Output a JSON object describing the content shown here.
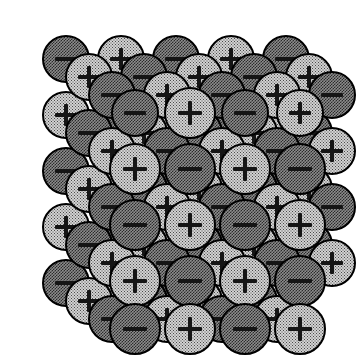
{
  "figure": {
    "title": "Ionic crystal lattice",
    "background_color": "#ffffff",
    "projection": "oblique",
    "grid_columns": 5,
    "grid_rows": 5,
    "depth_layers": 4,
    "sphere_diameter_px": 48,
    "spacing_x_px": 55,
    "spacing_y_px": 56,
    "depth_offset_x_px": -23,
    "depth_offset_y_px": -18,
    "front_layer_origin_x_px": 135,
    "front_layer_origin_y_px": 113
  },
  "legend": {
    "cation": {
      "name": "cation",
      "symbol": "+",
      "label": "positive ion",
      "fill_color": "#d2d2d2",
      "dither": "sparse-dot",
      "outline_color": "#000000"
    },
    "anion": {
      "name": "anion",
      "symbol": "−",
      "label": "negative ion",
      "fill_color": "#8c8c8c",
      "dither": "dense-checker",
      "outline_color": "#000000"
    }
  },
  "chart_data": {
    "type": "scatter",
    "title": "Ionic crystal lattice",
    "xlabel": "",
    "ylabel": "",
    "categories": [
      "cation",
      "anion"
    ],
    "values": [
      50,
      50
    ],
    "note": "Charge at lattice site (i,j,k) = '+' when (i+j+k) is even, '−' when odd"
  },
  "ions": [
    {
      "i": 0,
      "j": 0,
      "k": 3,
      "cx": 66,
      "cy": 59,
      "r": 24,
      "type": "anion",
      "symbol": "−"
    },
    {
      "i": 1,
      "j": 0,
      "k": 3,
      "cx": 121,
      "cy": 59,
      "r": 24,
      "type": "cation",
      "symbol": "+"
    },
    {
      "i": 2,
      "j": 0,
      "k": 3,
      "cx": 176,
      "cy": 59,
      "r": 24,
      "type": "anion",
      "symbol": "−"
    },
    {
      "i": 3,
      "j": 0,
      "k": 3,
      "cx": 231,
      "cy": 59,
      "r": 24,
      "type": "cation",
      "symbol": "+"
    },
    {
      "i": 4,
      "j": 0,
      "k": 3,
      "cx": 286,
      "cy": 59,
      "r": 24,
      "type": "anion",
      "symbol": "−"
    },
    {
      "i": 0,
      "j": 0,
      "k": 2,
      "cx": 89,
      "cy": 77,
      "r": 24,
      "type": "cation",
      "symbol": "+"
    },
    {
      "i": 1,
      "j": 0,
      "k": 2,
      "cx": 144,
      "cy": 77,
      "r": 24,
      "type": "anion",
      "symbol": "−"
    },
    {
      "i": 2,
      "j": 0,
      "k": 2,
      "cx": 199,
      "cy": 77,
      "r": 24,
      "type": "cation",
      "symbol": "+"
    },
    {
      "i": 3,
      "j": 0,
      "k": 2,
      "cx": 254,
      "cy": 77,
      "r": 24,
      "type": "anion",
      "symbol": "−"
    },
    {
      "i": 4,
      "j": 0,
      "k": 2,
      "cx": 309,
      "cy": 77,
      "r": 24,
      "type": "cation",
      "symbol": "+"
    },
    {
      "i": 0,
      "j": 0,
      "k": 1,
      "cx": 112,
      "cy": 95,
      "r": 24,
      "type": "anion",
      "symbol": "−"
    },
    {
      "i": 1,
      "j": 0,
      "k": 1,
      "cx": 167,
      "cy": 95,
      "r": 24,
      "type": "cation",
      "symbol": "+"
    },
    {
      "i": 2,
      "j": 0,
      "k": 1,
      "cx": 222,
      "cy": 95,
      "r": 24,
      "type": "anion",
      "symbol": "−"
    },
    {
      "i": 3,
      "j": 0,
      "k": 1,
      "cx": 277,
      "cy": 95,
      "r": 24,
      "type": "cation",
      "symbol": "+"
    },
    {
      "i": 4,
      "j": 0,
      "k": 1,
      "cx": 332,
      "cy": 95,
      "r": 24,
      "type": "anion",
      "symbol": "−"
    },
    {
      "i": 0,
      "j": 0,
      "k": 0,
      "cx": 135,
      "cy": 113,
      "r": 24,
      "type": "anion",
      "symbol": "−"
    },
    {
      "i": 1,
      "j": 0,
      "k": 0,
      "cx": 190,
      "cy": 113,
      "r": 24,
      "type": "cation",
      "symbol": "+"
    },
    {
      "i": 2,
      "j": 0,
      "k": 0,
      "cx": 245,
      "cy": 113,
      "r": 24,
      "type": "anion",
      "symbol": "−"
    },
    {
      "i": 3,
      "j": 0,
      "k": 0,
      "cx": 300,
      "cy": 113,
      "r": 24,
      "type": "cation",
      "symbol": "+"
    },
    {
      "i": 0,
      "j": 1,
      "k": 3,
      "cx": 66,
      "cy": 115,
      "r": 24,
      "type": "cation",
      "symbol": "+"
    },
    {
      "i": 0,
      "j": 2,
      "k": 3,
      "cx": 66,
      "cy": 171,
      "r": 24,
      "type": "anion",
      "symbol": "−"
    },
    {
      "i": 0,
      "j": 3,
      "k": 3,
      "cx": 66,
      "cy": 227,
      "r": 24,
      "type": "cation",
      "symbol": "+"
    },
    {
      "i": 0,
      "j": 4,
      "k": 3,
      "cx": 66,
      "cy": 283,
      "r": 24,
      "type": "anion",
      "symbol": "−"
    },
    {
      "i": 0,
      "j": 1,
      "k": 2,
      "cx": 89,
      "cy": 133,
      "r": 24,
      "type": "anion",
      "symbol": "−"
    },
    {
      "i": 0,
      "j": 2,
      "k": 2,
      "cx": 89,
      "cy": 189,
      "r": 24,
      "type": "cation",
      "symbol": "+"
    },
    {
      "i": 0,
      "j": 3,
      "k": 2,
      "cx": 89,
      "cy": 245,
      "r": 24,
      "type": "anion",
      "symbol": "−"
    },
    {
      "i": 0,
      "j": 4,
      "k": 2,
      "cx": 89,
      "cy": 301,
      "r": 24,
      "type": "cation",
      "symbol": "+"
    },
    {
      "i": 0,
      "j": 1,
      "k": 1,
      "cx": 112,
      "cy": 151,
      "r": 24,
      "type": "cation",
      "symbol": "+"
    },
    {
      "i": 0,
      "j": 2,
      "k": 1,
      "cx": 112,
      "cy": 207,
      "r": 24,
      "type": "anion",
      "symbol": "−"
    },
    {
      "i": 0,
      "j": 3,
      "k": 1,
      "cx": 112,
      "cy": 263,
      "r": 24,
      "type": "cation",
      "symbol": "+"
    },
    {
      "i": 0,
      "j": 4,
      "k": 1,
      "cx": 112,
      "cy": 319,
      "r": 24,
      "type": "anion",
      "symbol": "−"
    },
    {
      "i": 1,
      "j": 1,
      "k": 3,
      "cx": 121,
      "cy": 115,
      "r": 24,
      "type": "anion",
      "symbol": "−"
    },
    {
      "i": 2,
      "j": 1,
      "k": 3,
      "cx": 176,
      "cy": 115,
      "r": 24,
      "type": "cation",
      "symbol": "+"
    },
    {
      "i": 3,
      "j": 1,
      "k": 3,
      "cx": 231,
      "cy": 115,
      "r": 24,
      "type": "anion",
      "symbol": "−"
    },
    {
      "i": 4,
      "j": 1,
      "k": 3,
      "cx": 286,
      "cy": 115,
      "r": 24,
      "type": "cation",
      "symbol": "+"
    },
    {
      "i": 1,
      "j": 1,
      "k": 2,
      "cx": 144,
      "cy": 133,
      "r": 24,
      "type": "cation",
      "symbol": "+"
    },
    {
      "i": 2,
      "j": 1,
      "k": 2,
      "cx": 199,
      "cy": 133,
      "r": 24,
      "type": "anion",
      "symbol": "−"
    },
    {
      "i": 3,
      "j": 1,
      "k": 2,
      "cx": 254,
      "cy": 133,
      "r": 24,
      "type": "cation",
      "symbol": "+"
    },
    {
      "i": 4,
      "j": 1,
      "k": 2,
      "cx": 309,
      "cy": 133,
      "r": 24,
      "type": "anion",
      "symbol": "−"
    },
    {
      "i": 1,
      "j": 1,
      "k": 1,
      "cx": 167,
      "cy": 151,
      "r": 24,
      "type": "anion",
      "symbol": "−"
    },
    {
      "i": 2,
      "j": 1,
      "k": 1,
      "cx": 222,
      "cy": 151,
      "r": 24,
      "type": "cation",
      "symbol": "+"
    },
    {
      "i": 3,
      "j": 1,
      "k": 1,
      "cx": 277,
      "cy": 151,
      "r": 24,
      "type": "anion",
      "symbol": "−"
    },
    {
      "i": 4,
      "j": 1,
      "k": 1,
      "cx": 332,
      "cy": 151,
      "r": 24,
      "type": "cation",
      "symbol": "+"
    },
    {
      "i": 1,
      "j": 2,
      "k": 3,
      "cx": 121,
      "cy": 171,
      "r": 24,
      "type": "cation",
      "symbol": "+"
    },
    {
      "i": 2,
      "j": 2,
      "k": 3,
      "cx": 176,
      "cy": 171,
      "r": 24,
      "type": "anion",
      "symbol": "−"
    },
    {
      "i": 3,
      "j": 2,
      "k": 3,
      "cx": 231,
      "cy": 171,
      "r": 24,
      "type": "cation",
      "symbol": "+"
    },
    {
      "i": 4,
      "j": 2,
      "k": 3,
      "cx": 286,
      "cy": 171,
      "r": 24,
      "type": "anion",
      "symbol": "−"
    },
    {
      "i": 1,
      "j": 2,
      "k": 2,
      "cx": 144,
      "cy": 189,
      "r": 24,
      "type": "anion",
      "symbol": "−"
    },
    {
      "i": 2,
      "j": 2,
      "k": 2,
      "cx": 199,
      "cy": 189,
      "r": 24,
      "type": "cation",
      "symbol": "+"
    },
    {
      "i": 3,
      "j": 2,
      "k": 2,
      "cx": 254,
      "cy": 189,
      "r": 24,
      "type": "anion",
      "symbol": "−"
    },
    {
      "i": 4,
      "j": 2,
      "k": 2,
      "cx": 309,
      "cy": 189,
      "r": 24,
      "type": "cation",
      "symbol": "+"
    },
    {
      "i": 1,
      "j": 2,
      "k": 1,
      "cx": 167,
      "cy": 207,
      "r": 24,
      "type": "cation",
      "symbol": "+"
    },
    {
      "i": 2,
      "j": 2,
      "k": 1,
      "cx": 222,
      "cy": 207,
      "r": 24,
      "type": "anion",
      "symbol": "−"
    },
    {
      "i": 3,
      "j": 2,
      "k": 1,
      "cx": 277,
      "cy": 207,
      "r": 24,
      "type": "cation",
      "symbol": "+"
    },
    {
      "i": 4,
      "j": 2,
      "k": 1,
      "cx": 332,
      "cy": 207,
      "r": 24,
      "type": "anion",
      "symbol": "−"
    },
    {
      "i": 1,
      "j": 3,
      "k": 3,
      "cx": 121,
      "cy": 227,
      "r": 24,
      "type": "anion",
      "symbol": "−"
    },
    {
      "i": 2,
      "j": 3,
      "k": 3,
      "cx": 176,
      "cy": 227,
      "r": 24,
      "type": "cation",
      "symbol": "+"
    },
    {
      "i": 3,
      "j": 3,
      "k": 3,
      "cx": 231,
      "cy": 227,
      "r": 24,
      "type": "anion",
      "symbol": "−"
    },
    {
      "i": 4,
      "j": 3,
      "k": 3,
      "cx": 286,
      "cy": 227,
      "r": 24,
      "type": "cation",
      "symbol": "+"
    },
    {
      "i": 1,
      "j": 3,
      "k": 2,
      "cx": 144,
      "cy": 245,
      "r": 24,
      "type": "cation",
      "symbol": "+"
    },
    {
      "i": 2,
      "j": 3,
      "k": 2,
      "cx": 199,
      "cy": 245,
      "r": 24,
      "type": "anion",
      "symbol": "−"
    },
    {
      "i": 3,
      "j": 3,
      "k": 2,
      "cx": 254,
      "cy": 245,
      "r": 24,
      "type": "cation",
      "symbol": "+"
    },
    {
      "i": 4,
      "j": 3,
      "k": 2,
      "cx": 309,
      "cy": 245,
      "r": 24,
      "type": "anion",
      "symbol": "−"
    },
    {
      "i": 1,
      "j": 3,
      "k": 1,
      "cx": 167,
      "cy": 263,
      "r": 24,
      "type": "anion",
      "symbol": "−"
    },
    {
      "i": 2,
      "j": 3,
      "k": 1,
      "cx": 222,
      "cy": 263,
      "r": 24,
      "type": "cation",
      "symbol": "+"
    },
    {
      "i": 3,
      "j": 3,
      "k": 1,
      "cx": 277,
      "cy": 263,
      "r": 24,
      "type": "anion",
      "symbol": "−"
    },
    {
      "i": 4,
      "j": 3,
      "k": 1,
      "cx": 332,
      "cy": 263,
      "r": 24,
      "type": "cation",
      "symbol": "+"
    },
    {
      "i": 1,
      "j": 4,
      "k": 3,
      "cx": 121,
      "cy": 283,
      "r": 24,
      "type": "cation",
      "symbol": "+"
    },
    {
      "i": 2,
      "j": 4,
      "k": 3,
      "cx": 176,
      "cy": 283,
      "r": 24,
      "type": "anion",
      "symbol": "−"
    },
    {
      "i": 1,
      "j": 4,
      "k": 2,
      "cx": 144,
      "cy": 301,
      "r": 24,
      "type": "anion",
      "symbol": "−"
    },
    {
      "i": 2,
      "j": 4,
      "k": 2,
      "cx": 199,
      "cy": 301,
      "r": 24,
      "type": "cation",
      "symbol": "+"
    },
    {
      "i": 3,
      "j": 4,
      "k": 2,
      "cx": 254,
      "cy": 301,
      "r": 24,
      "type": "anion",
      "symbol": "−"
    },
    {
      "i": 1,
      "j": 4,
      "k": 1,
      "cx": 167,
      "cy": 319,
      "r": 24,
      "type": "cation",
      "symbol": "+"
    },
    {
      "i": 2,
      "j": 4,
      "k": 1,
      "cx": 222,
      "cy": 319,
      "r": 24,
      "type": "anion",
      "symbol": "−"
    },
    {
      "i": 3,
      "j": 4,
      "k": 1,
      "cx": 277,
      "cy": 319,
      "r": 24,
      "type": "cation",
      "symbol": "+"
    },
    {
      "i": 1,
      "j": 0,
      "k": 0,
      "cx": 190,
      "cy": 113,
      "r": 26,
      "type": "cation",
      "symbol": "+",
      "front": true
    },
    {
      "i": 0,
      "j": 1,
      "k": 0,
      "cx": 135,
      "cy": 169,
      "r": 26,
      "type": "cation",
      "symbol": "+",
      "front": true
    },
    {
      "i": 1,
      "j": 1,
      "k": 0,
      "cx": 190,
      "cy": 169,
      "r": 26,
      "type": "anion",
      "symbol": "−",
      "front": true
    },
    {
      "i": 2,
      "j": 1,
      "k": 0,
      "cx": 245,
      "cy": 169,
      "r": 26,
      "type": "cation",
      "symbol": "+",
      "front": true
    },
    {
      "i": 3,
      "j": 1,
      "k": 0,
      "cx": 300,
      "cy": 169,
      "r": 26,
      "type": "anion",
      "symbol": "−",
      "front": true
    },
    {
      "i": 0,
      "j": 2,
      "k": 0,
      "cx": 135,
      "cy": 225,
      "r": 26,
      "type": "anion",
      "symbol": "−",
      "front": true
    },
    {
      "i": 1,
      "j": 2,
      "k": 0,
      "cx": 190,
      "cy": 225,
      "r": 26,
      "type": "cation",
      "symbol": "+",
      "front": true
    },
    {
      "i": 2,
      "j": 2,
      "k": 0,
      "cx": 245,
      "cy": 225,
      "r": 26,
      "type": "anion",
      "symbol": "−",
      "front": true
    },
    {
      "i": 3,
      "j": 2,
      "k": 0,
      "cx": 300,
      "cy": 225,
      "r": 26,
      "type": "cation",
      "symbol": "+",
      "front": true
    },
    {
      "i": 0,
      "j": 3,
      "k": 0,
      "cx": 135,
      "cy": 281,
      "r": 26,
      "type": "cation",
      "symbol": "+",
      "front": true
    },
    {
      "i": 1,
      "j": 3,
      "k": 0,
      "cx": 190,
      "cy": 281,
      "r": 26,
      "type": "anion",
      "symbol": "−",
      "front": true
    },
    {
      "i": 2,
      "j": 3,
      "k": 0,
      "cx": 245,
      "cy": 281,
      "r": 26,
      "type": "cation",
      "symbol": "+",
      "front": true
    },
    {
      "i": 3,
      "j": 3,
      "k": 0,
      "cx": 300,
      "cy": 281,
      "r": 26,
      "type": "anion",
      "symbol": "−",
      "front": true
    },
    {
      "i": 0,
      "j": 4,
      "k": 0,
      "cx": 135,
      "cy": 329,
      "r": 26,
      "type": "anion",
      "symbol": "−",
      "front": true
    },
    {
      "i": 1,
      "j": 4,
      "k": 0,
      "cx": 190,
      "cy": 329,
      "r": 26,
      "type": "cation",
      "symbol": "+",
      "front": true
    },
    {
      "i": 2,
      "j": 4,
      "k": 0,
      "cx": 245,
      "cy": 329,
      "r": 26,
      "type": "anion",
      "symbol": "−",
      "front": true
    },
    {
      "i": 3,
      "j": 4,
      "k": 0,
      "cx": 300,
      "cy": 329,
      "r": 26,
      "type": "cation",
      "symbol": "+",
      "front": true
    }
  ]
}
